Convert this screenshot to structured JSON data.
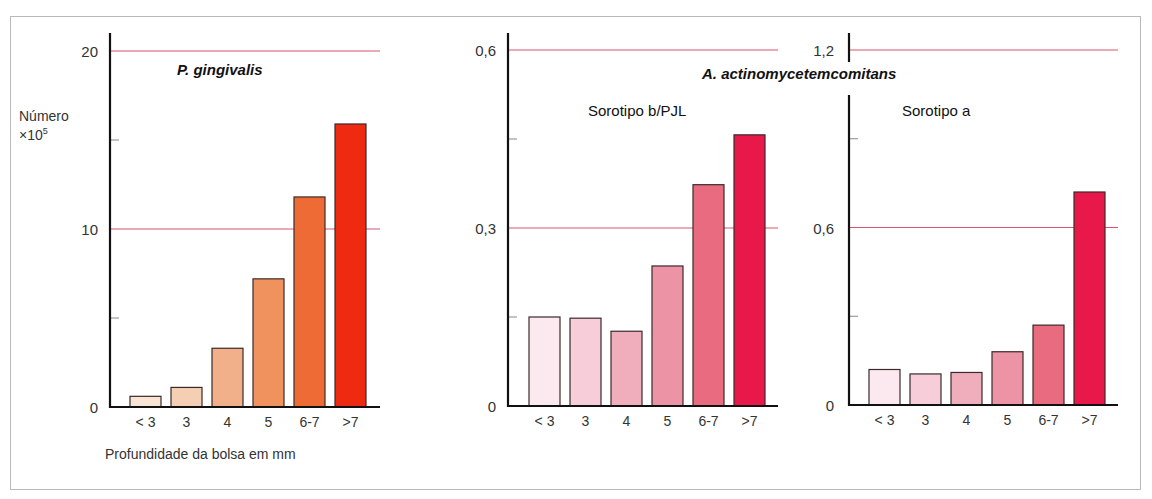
{
  "figure": {
    "y_axis_label_line1": "Número",
    "y_axis_label_line2": "×10",
    "y_axis_label_exp": "5",
    "x_axis_label": "Profundidade da bolsa em mm",
    "shared_title": "A. actinomycetemcomitans"
  },
  "chart_data": [
    {
      "type": "bar",
      "title": "P. gingivalis",
      "xlabel": "Profundidade da bolsa em mm",
      "ylabel": "Número ×10^5",
      "categories": [
        "< 3",
        "3",
        "4",
        "5",
        "6-7",
        ">7"
      ],
      "values": [
        0.6,
        1.1,
        3.3,
        7.2,
        11.8,
        15.9
      ],
      "ylim": [
        0,
        20
      ],
      "yticks": [
        "0",
        "10",
        "20"
      ],
      "minor_ticks": [
        5,
        15
      ],
      "gridlines": [
        10,
        20
      ],
      "colors": [
        "#f7e4d4",
        "#f5cfb4",
        "#f2b08a",
        "#f0925e",
        "#ef6b35",
        "#ee2a10"
      ]
    },
    {
      "type": "bar",
      "title": "Sorotipo b/PJL",
      "group_title": "A. actinomycetemcomitans",
      "categories": [
        "< 3",
        "3",
        "4",
        "5",
        "6-7",
        ">7"
      ],
      "values": [
        0.15,
        0.148,
        0.126,
        0.236,
        0.373,
        0.457
      ],
      "ylim": [
        0,
        0.6
      ],
      "yticks": [
        "0",
        "0,3",
        "0,6"
      ],
      "minor_ticks": [
        0.15,
        0.45
      ],
      "gridlines": [
        0.3,
        0.6
      ],
      "colors": [
        "#fbe9ef",
        "#f6cdd8",
        "#f0aebd",
        "#ec94a5",
        "#e86b80",
        "#e8184a"
      ]
    },
    {
      "type": "bar",
      "title": "Sorotipo a",
      "group_title": "A. actinomycetemcomitans",
      "categories": [
        "< 3",
        "3",
        "4",
        "5",
        "6-7",
        ">7"
      ],
      "values": [
        0.12,
        0.105,
        0.11,
        0.18,
        0.27,
        0.72
      ],
      "ylim": [
        0,
        1.2
      ],
      "yticks": [
        "0",
        "0,6",
        "1,2"
      ],
      "minor_ticks": [
        0.3,
        0.9
      ],
      "gridlines": [
        0.6,
        1.2
      ],
      "colors": [
        "#fbe9ef",
        "#f6cdd8",
        "#f0aebd",
        "#ec94a5",
        "#e86b80",
        "#e8184a"
      ]
    }
  ],
  "style": {
    "gridline_color": "#d8536d",
    "axis_color": "#111111",
    "bar_outline": "#3a2a2a"
  }
}
